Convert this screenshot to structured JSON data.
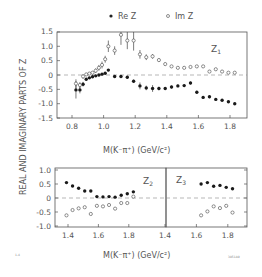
{
  "legend": {
    "re_label": "Re Z",
    "im_label": "Im Z"
  },
  "y_axis_label": "REAL AND IMAGINARY PARTS OF Z",
  "x_axis_label": "M(K⁻π⁺)   (GeV/c²)",
  "footer": {
    "left": "1-4",
    "right": "3851A9"
  },
  "chart_data": [
    {
      "type": "scatter",
      "title": "Z1",
      "xlabel": "M(K-pi+) (GeV/c^2)",
      "ylabel": "REAL AND IMAGINARY PARTS OF Z",
      "xlim": [
        0.73,
        1.9
      ],
      "ylim": [
        -1.5,
        1.5
      ],
      "x_ticks": [
        "0.8",
        "1.0",
        "1.2",
        "1.4",
        "1.6",
        "1.8"
      ],
      "y_ticks": [
        "1.5",
        "1.0",
        "0.5",
        "0",
        "-0.5",
        "-1.0",
        "-1.5"
      ],
      "zero_line": "dashed",
      "series": [
        {
          "name": "Re Z",
          "marker": "filled-circle",
          "points": [
            {
              "x": 0.825,
              "y": -0.52,
              "err": 0.3
            },
            {
              "x": 0.85,
              "y": -0.52,
              "err": 0.12
            },
            {
              "x": 0.87,
              "y": -0.32,
              "err": 0.08
            },
            {
              "x": 0.89,
              "y": -0.15,
              "err": 0.05
            },
            {
              "x": 0.91,
              "y": -0.1,
              "err": 0.04
            },
            {
              "x": 0.93,
              "y": -0.06,
              "err": 0.03
            },
            {
              "x": 0.95,
              "y": -0.03,
              "err": 0.03
            },
            {
              "x": 0.97,
              "y": 0.0,
              "err": 0.03
            },
            {
              "x": 0.99,
              "y": 0.03,
              "err": 0.03
            },
            {
              "x": 1.01,
              "y": 0.06,
              "err": 0.03
            },
            {
              "x": 1.03,
              "y": 0.17,
              "err": 0.04
            },
            {
              "x": 1.07,
              "y": -0.05,
              "err": 0.04
            },
            {
              "x": 1.11,
              "y": -0.05,
              "err": 0.04
            },
            {
              "x": 1.15,
              "y": -0.08,
              "err": 0.05
            },
            {
              "x": 1.19,
              "y": -0.22,
              "err": 0.06
            },
            {
              "x": 1.23,
              "y": -0.38,
              "err": 0.12
            },
            {
              "x": 1.27,
              "y": -0.45,
              "err": 0.08
            },
            {
              "x": 1.31,
              "y": -0.47,
              "err": 0.12
            },
            {
              "x": 1.35,
              "y": -0.47,
              "err": 0.06
            },
            {
              "x": 1.39,
              "y": -0.47,
              "err": 0.05
            },
            {
              "x": 1.43,
              "y": -0.42,
              "err": 0.05
            },
            {
              "x": 1.47,
              "y": -0.38,
              "err": 0.05
            },
            {
              "x": 1.51,
              "y": -0.37,
              "err": 0.05
            },
            {
              "x": 1.55,
              "y": -0.28,
              "err": 0.05
            },
            {
              "x": 1.59,
              "y": -0.6,
              "err": 0.05
            },
            {
              "x": 1.63,
              "y": -0.78,
              "err": 0.05
            },
            {
              "x": 1.67,
              "y": -0.76,
              "err": 0.05
            },
            {
              "x": 1.71,
              "y": -0.85,
              "err": 0.04
            },
            {
              "x": 1.75,
              "y": -0.88,
              "err": 0.04
            },
            {
              "x": 1.79,
              "y": -0.93,
              "err": 0.04
            },
            {
              "x": 1.83,
              "y": -1.0,
              "err": 0.04
            }
          ]
        },
        {
          "name": "Im Z",
          "marker": "open-circle",
          "points": [
            {
              "x": 0.825,
              "y": -0.3,
              "err": 0.15
            },
            {
              "x": 0.85,
              "y": -0.35,
              "err": 0.1
            },
            {
              "x": 0.87,
              "y": -0.05,
              "err": 0.08
            },
            {
              "x": 0.89,
              "y": 0.02,
              "err": 0.05
            },
            {
              "x": 0.91,
              "y": 0.05,
              "err": 0.05
            },
            {
              "x": 0.93,
              "y": 0.08,
              "err": 0.06
            },
            {
              "x": 0.95,
              "y": 0.15,
              "err": 0.08
            },
            {
              "x": 0.97,
              "y": 0.25,
              "err": 0.1
            },
            {
              "x": 0.99,
              "y": 0.35,
              "err": 0.12
            },
            {
              "x": 1.01,
              "y": 0.55,
              "err": 0.12
            },
            {
              "x": 1.03,
              "y": 1.0,
              "err": 0.2
            },
            {
              "x": 1.07,
              "y": 0.85,
              "err": 0.15
            },
            {
              "x": 1.11,
              "y": 1.4,
              "err": 0.35
            },
            {
              "x": 1.15,
              "y": 1.2,
              "err": 0.3
            },
            {
              "x": 1.19,
              "y": 1.2,
              "err": 0.35
            },
            {
              "x": 1.23,
              "y": 0.72,
              "err": 0.15
            },
            {
              "x": 1.27,
              "y": 0.62,
              "err": 0.1
            },
            {
              "x": 1.31,
              "y": 0.65,
              "err": 0.08
            },
            {
              "x": 1.35,
              "y": 0.52,
              "err": 0.06
            },
            {
              "x": 1.39,
              "y": 0.38,
              "err": 0.05
            },
            {
              "x": 1.43,
              "y": 0.3,
              "err": 0.04
            },
            {
              "x": 1.47,
              "y": 0.25,
              "err": 0.04
            },
            {
              "x": 1.51,
              "y": 0.25,
              "err": 0.04
            },
            {
              "x": 1.55,
              "y": 0.28,
              "err": 0.04
            },
            {
              "x": 1.59,
              "y": 0.3,
              "err": 0.04
            },
            {
              "x": 1.63,
              "y": 0.3,
              "err": 0.04
            },
            {
              "x": 1.67,
              "y": 0.12,
              "err": 0.04
            },
            {
              "x": 1.71,
              "y": 0.2,
              "err": 0.04
            },
            {
              "x": 1.75,
              "y": 0.12,
              "err": 0.04
            },
            {
              "x": 1.79,
              "y": 0.08,
              "err": 0.04
            },
            {
              "x": 1.83,
              "y": 0.08,
              "err": 0.04
            }
          ]
        }
      ]
    },
    {
      "type": "scatter",
      "title": "Z2",
      "xlim": [
        1.34,
        1.89
      ],
      "ylim": [
        -1.0,
        1.0
      ],
      "x_ticks": [
        "1.4",
        "1.6",
        "1.8"
      ],
      "y_ticks": [
        "1.0",
        "0.5",
        "0",
        "-0.5",
        "-1.0"
      ],
      "zero_line": "dashed",
      "series": [
        {
          "name": "Re Z",
          "marker": "filled-circle",
          "points": [
            {
              "x": 1.39,
              "y": 0.55
            },
            {
              "x": 1.43,
              "y": 0.43
            },
            {
              "x": 1.47,
              "y": 0.35
            },
            {
              "x": 1.51,
              "y": 0.25
            },
            {
              "x": 1.55,
              "y": 0.25
            },
            {
              "x": 1.59,
              "y": 0.05
            },
            {
              "x": 1.63,
              "y": 0.04
            },
            {
              "x": 1.67,
              "y": 0.05
            },
            {
              "x": 1.71,
              "y": 0.03
            },
            {
              "x": 1.75,
              "y": 0.1
            },
            {
              "x": 1.79,
              "y": 0.15
            },
            {
              "x": 1.83,
              "y": 0.22
            }
          ]
        },
        {
          "name": "Im Z",
          "marker": "open-circle",
          "points": [
            {
              "x": 1.39,
              "y": -0.62
            },
            {
              "x": 1.43,
              "y": -0.43
            },
            {
              "x": 1.47,
              "y": -0.37
            },
            {
              "x": 1.51,
              "y": -0.33
            },
            {
              "x": 1.55,
              "y": -0.57
            },
            {
              "x": 1.59,
              "y": -0.28
            },
            {
              "x": 1.63,
              "y": -0.3
            },
            {
              "x": 1.67,
              "y": -0.25
            },
            {
              "x": 1.71,
              "y": -0.38
            },
            {
              "x": 1.75,
              "y": -0.18
            },
            {
              "x": 1.79,
              "y": -0.18
            },
            {
              "x": 1.83,
              "y": 0.05
            }
          ]
        }
      ]
    },
    {
      "type": "scatter",
      "title": "Z3",
      "xlim": [
        1.4,
        1.92
      ],
      "ylim": [
        -1.0,
        1.0
      ],
      "x_ticks": [
        "1.4",
        "1.6",
        "1.8"
      ],
      "zero_line": "dashed",
      "series": [
        {
          "name": "Re Z",
          "marker": "filled-circle",
          "points": [
            {
              "x": 1.63,
              "y": 0.5
            },
            {
              "x": 1.67,
              "y": 0.55
            },
            {
              "x": 1.71,
              "y": 0.42
            },
            {
              "x": 1.75,
              "y": 0.45
            },
            {
              "x": 1.79,
              "y": 0.38
            },
            {
              "x": 1.83,
              "y": 0.33
            }
          ]
        },
        {
          "name": "Im Z",
          "marker": "open-circle",
          "points": [
            {
              "x": 1.63,
              "y": -0.62
            },
            {
              "x": 1.67,
              "y": -0.48
            },
            {
              "x": 1.71,
              "y": -0.3
            },
            {
              "x": 1.75,
              "y": -0.36
            },
            {
              "x": 1.79,
              "y": -0.28
            },
            {
              "x": 1.83,
              "y": -0.52
            }
          ]
        }
      ]
    }
  ],
  "panels": {
    "z1": {
      "label": "Z",
      "sub": "1",
      "x_ticks": [
        "0.8",
        "1.0",
        "1.2",
        "1.4",
        "1.6",
        "1.8"
      ],
      "y_ticks": [
        "1.5",
        "1.0",
        "0.5",
        "0",
        "-0.5",
        "-1.0",
        "-1.5"
      ]
    },
    "z2": {
      "label": "Z",
      "sub": "2",
      "x_ticks": [
        "1.4",
        "1.6",
        "1.8"
      ],
      "y_ticks": [
        "1.0",
        "0.5",
        "0",
        "-0.5",
        "-1.0"
      ]
    },
    "z3": {
      "label": "Z",
      "sub": "3",
      "x_ticks": [
        "1.4",
        "1.6",
        "1.8"
      ]
    }
  }
}
